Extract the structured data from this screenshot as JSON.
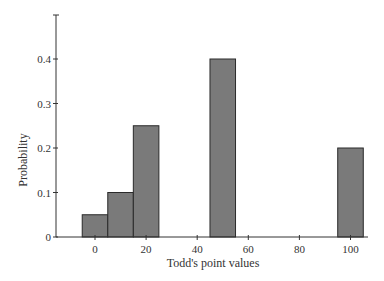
{
  "chart_data": {
    "type": "bar",
    "title": "",
    "xlabel": "Todd's point values",
    "ylabel": "Probability",
    "categories": [
      0,
      10,
      20,
      50,
      100
    ],
    "values": [
      0.05,
      0.1,
      0.25,
      0.4,
      0.2
    ],
    "x_ticks": [
      "0",
      "20",
      "40",
      "60",
      "80",
      "100"
    ],
    "y_ticks": [
      "0",
      "0.1",
      "0.2",
      "0.3",
      "0.4"
    ],
    "xlim": [
      -10,
      105
    ],
    "ylim": [
      0,
      0.5
    ],
    "bar_width": 10,
    "grid": false,
    "legend": null,
    "colors": {
      "bar_fill": "#7a7a7a",
      "bar_edge": "#2a2a2a",
      "axis": "#333333"
    }
  }
}
